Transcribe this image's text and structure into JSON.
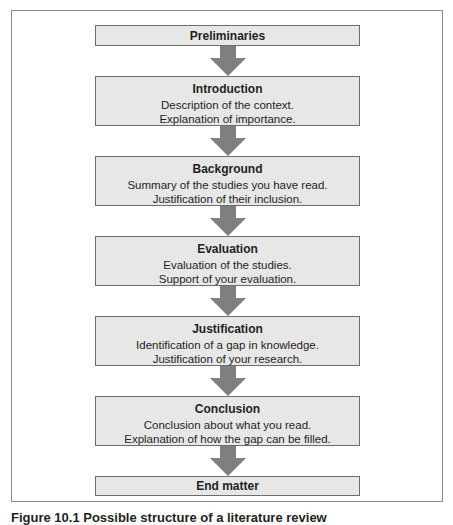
{
  "diagram": {
    "type": "flowchart",
    "direction": "top-to-bottom",
    "colors": {
      "box_fill": "#e7e7e7",
      "box_border": "#6d6d6d",
      "arrow": "#7f7f7f",
      "frame": "#8a8a8a"
    },
    "steps": [
      {
        "title": "Preliminaries",
        "lines": []
      },
      {
        "title": "Introduction",
        "lines": [
          "Description of the context.",
          "Explanation of importance."
        ]
      },
      {
        "title": "Background",
        "lines": [
          "Summary of the studies you have read.",
          "Justification of their inclusion."
        ]
      },
      {
        "title": "Evaluation",
        "lines": [
          "Evaluation of the studies.",
          "Support of your evaluation."
        ]
      },
      {
        "title": "Justification",
        "lines": [
          "Identification of a gap in knowledge.",
          "Justification of your research."
        ]
      },
      {
        "title": "Conclusion",
        "lines": [
          "Conclusion about what you read.",
          "Explanation of how the gap can be filled."
        ]
      },
      {
        "title": "End matter",
        "lines": []
      }
    ]
  },
  "caption": "Figure 10.1 Possible structure of a literature review"
}
